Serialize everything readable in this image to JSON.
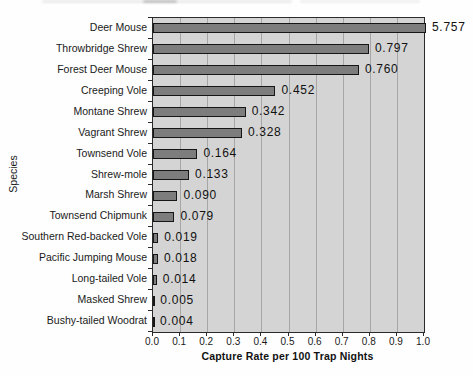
{
  "chart_data": {
    "type": "bar",
    "orientation": "horizontal",
    "title": "",
    "xlabel": "Capture Rate per 100 Trap Nights",
    "ylabel": "Species",
    "xlim": [
      0,
      1.0
    ],
    "xticks": [
      "0.0",
      "0.1",
      "0.2",
      "0.3",
      "0.4",
      "0.5",
      "0.6",
      "0.7",
      "0.8",
      "0.9",
      "1.0"
    ],
    "grid": "vertical-gridlines-every-0.1",
    "legend": "none",
    "categories": [
      "Deer Mouse",
      "Throwbridge Shrew",
      "Forest Deer Mouse",
      "Creeping Vole",
      "Montane Shrew",
      "Vagrant Shrew",
      "Townsend Vole",
      "Shrew-mole",
      "Marsh Shrew",
      "Townsend Chipmunk",
      "Southern Red-backed Vole",
      "Pacific Jumping Mouse",
      "Long-tailed Vole",
      "Masked Shrew",
      "Bushy-tailed Woodrat"
    ],
    "values": [
      5.757,
      0.797,
      0.76,
      0.452,
      0.342,
      0.328,
      0.164,
      0.133,
      0.09,
      0.079,
      0.019,
      0.018,
      0.014,
      0.005,
      0.004
    ],
    "value_labels": [
      "5.757",
      "0.797",
      "0.760",
      "0.452",
      "0.342",
      "0.328",
      "0.164",
      "0.133",
      "0.090",
      "0.079",
      "0.019",
      "0.018",
      "0.014",
      "0.005",
      "0.004"
    ],
    "note": "Deer Mouse bar (5.757) is clipped at the 1.0 axis maximum",
    "colors": {
      "bar_fill": "#7d7d7d",
      "bar_border": "#161616",
      "plot_background": "#d4d4d4",
      "gridline": "#a6a6a6",
      "frame": "#2a2a2a",
      "text": "#1a1a1a",
      "page_background": "#fefefe"
    }
  }
}
